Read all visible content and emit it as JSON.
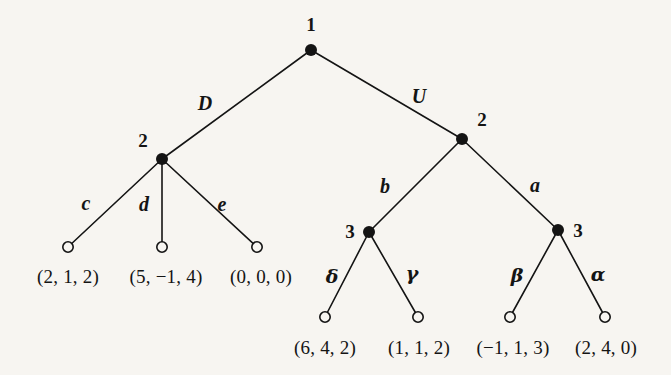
{
  "figure": {
    "kind": "extensive-form-game-tree",
    "background_color": "#f7f5f1",
    "ink_color": "#141414"
  },
  "nodes": {
    "root": {
      "player_label": "1",
      "x": 311,
      "y": 50,
      "label_x": 311,
      "label_y": 24
    },
    "left_p2": {
      "player_label": "2",
      "x": 162,
      "y": 159,
      "label_x": 143,
      "label_y": 140
    },
    "right_p2": {
      "player_label": "2",
      "x": 462,
      "y": 139,
      "label_x": 482,
      "label_y": 119
    },
    "left_p3": {
      "player_label": "3",
      "x": 369,
      "y": 232,
      "label_x": 350,
      "label_y": 231
    },
    "right_p3": {
      "player_label": "3",
      "x": 558,
      "y": 230,
      "label_x": 578,
      "label_y": 230
    }
  },
  "terminals": [
    {
      "id": "t_c",
      "x": 68,
      "y": 247,
      "payoff": "(2, 1, 2)",
      "payoff_x": 68,
      "payoff_y": 276
    },
    {
      "id": "t_d",
      "x": 162,
      "y": 247,
      "payoff": "(5, −1, 4)",
      "payoff_x": 166,
      "payoff_y": 276
    },
    {
      "id": "t_e",
      "x": 257,
      "y": 247,
      "payoff": "(0, 0, 0)",
      "payoff_x": 261,
      "payoff_y": 276
    },
    {
      "id": "t_delta",
      "x": 325,
      "y": 317,
      "payoff": "(6, 4, 2)",
      "payoff_x": 325,
      "payoff_y": 347
    },
    {
      "id": "t_gamma",
      "x": 418,
      "y": 317,
      "payoff": "(1, 1, 2)",
      "payoff_x": 419,
      "payoff_y": 347
    },
    {
      "id": "t_beta",
      "x": 510,
      "y": 317,
      "payoff": "(−1, 1, 3)",
      "payoff_x": 513,
      "payoff_y": 347
    },
    {
      "id": "t_alpha",
      "x": 605,
      "y": 317,
      "payoff": "(2, 4, 0)",
      "payoff_x": 606,
      "payoff_y": 347
    }
  ],
  "edges": [
    {
      "id": "edge-D",
      "label": "D",
      "style": "roman",
      "x1": 311,
      "y1": 50,
      "x2": 162,
      "y2": 159,
      "label_x": 205,
      "label_y": 103
    },
    {
      "id": "edge-U",
      "label": "U",
      "style": "roman",
      "x1": 311,
      "y1": 50,
      "x2": 462,
      "y2": 139,
      "label_x": 419,
      "label_y": 96
    },
    {
      "id": "edge-c",
      "label": "c",
      "style": "roman",
      "x1": 162,
      "y1": 159,
      "x2": 68,
      "y2": 247,
      "label_x": 86,
      "label_y": 203
    },
    {
      "id": "edge-d",
      "label": "d",
      "style": "roman",
      "x1": 162,
      "y1": 159,
      "x2": 162,
      "y2": 247,
      "label_x": 144,
      "label_y": 204
    },
    {
      "id": "edge-e",
      "label": "e",
      "style": "roman",
      "x1": 162,
      "y1": 159,
      "x2": 257,
      "y2": 247,
      "label_x": 222,
      "label_y": 204
    },
    {
      "id": "edge-b",
      "label": "b",
      "style": "roman",
      "x1": 462,
      "y1": 139,
      "x2": 369,
      "y2": 232,
      "label_x": 385,
      "label_y": 186
    },
    {
      "id": "edge-a",
      "label": "a",
      "style": "roman",
      "x1": 462,
      "y1": 139,
      "x2": 558,
      "y2": 230,
      "label_x": 535,
      "label_y": 185
    },
    {
      "id": "edge-delta",
      "label": "δ",
      "style": "greek",
      "x1": 369,
      "y1": 232,
      "x2": 325,
      "y2": 317,
      "label_x": 332,
      "label_y": 276
    },
    {
      "id": "edge-gamma",
      "label": "γ",
      "style": "greek",
      "x1": 369,
      "y1": 232,
      "x2": 418,
      "y2": 317,
      "label_x": 412,
      "label_y": 273
    },
    {
      "id": "edge-beta",
      "label": "β",
      "style": "greek",
      "x1": 558,
      "y1": 230,
      "x2": 510,
      "y2": 317,
      "label_x": 517,
      "label_y": 275
    },
    {
      "id": "edge-alpha",
      "label": "α",
      "style": "greek",
      "x1": 558,
      "y1": 230,
      "x2": 605,
      "y2": 317,
      "label_x": 598,
      "label_y": 274
    }
  ]
}
